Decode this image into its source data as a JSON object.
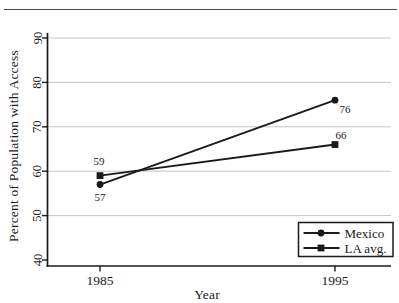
{
  "figure": {
    "background": "#ffffff",
    "rule_color": "#4a4a4a"
  },
  "chart_data": {
    "type": "line",
    "title": "",
    "xlabel": "Year",
    "ylabel": "Percent of Population with Access",
    "categories": [
      "1985",
      "1995"
    ],
    "ylim": [
      40,
      90
    ],
    "yticks": [
      40,
      50,
      60,
      70,
      80,
      90
    ],
    "grid": "horizontal",
    "legend_position": "bottom-right",
    "line_color": "#1a1a1a",
    "text_color": "#1a1a1a",
    "gridline_color": "#c6c6c6",
    "series": [
      {
        "name": "Mexico",
        "marker": "circle",
        "values": [
          57,
          76
        ],
        "point_labels": [
          "57",
          "76"
        ],
        "label_placement": [
          "below",
          "below-right"
        ]
      },
      {
        "name": "LA avg.",
        "marker": "square",
        "values": [
          59,
          66
        ],
        "point_labels": [
          "59",
          "66"
        ],
        "label_placement": [
          "above",
          "above-right"
        ]
      }
    ]
  }
}
